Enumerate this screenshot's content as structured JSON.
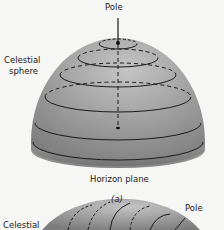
{
  "figure_a": {
    "pole_label": "Pole",
    "sphere_label_line1": "Celestial",
    "sphere_label_line2": "sphere",
    "horizon_label": "Horizon plane",
    "caption": "(a)"
  },
  "figure_b": {
    "sphere_label_line1": "Celestial",
    "pole_label": "Pole"
  },
  "colors": {
    "dome_light": "#b9b9b9",
    "dome_dark": "#7a7a7a",
    "line": "#1a1a1a",
    "background": "#f6f6f4"
  }
}
